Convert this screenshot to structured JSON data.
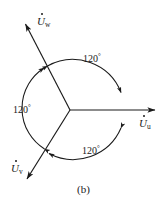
{
  "figure": {
    "caption": "(b)",
    "type": "three-phase-phasor-diagram",
    "stroke_color": "#1a1a1a",
    "background_color": "#ffffff"
  },
  "phasors": [
    {
      "id": "u",
      "symbol": "U",
      "subscript": "u",
      "label_text": "U",
      "angle_deg": 0,
      "overdot": true
    },
    {
      "id": "w",
      "symbol": "U",
      "subscript": "w",
      "label_text": "U",
      "angle_deg": 120,
      "overdot": true
    },
    {
      "id": "v",
      "symbol": "U",
      "subscript": "v",
      "label_text": "U",
      "angle_deg": 240,
      "overdot": true
    }
  ],
  "angles": [
    {
      "id": "top",
      "value": "120",
      "degree_symbol": "°",
      "between": [
        "w",
        "u"
      ]
    },
    {
      "id": "left",
      "value": "120",
      "degree_symbol": "°",
      "between": [
        "v",
        "w"
      ]
    },
    {
      "id": "bottom",
      "value": "120",
      "degree_symbol": "°",
      "between": [
        "u",
        "v"
      ]
    }
  ]
}
